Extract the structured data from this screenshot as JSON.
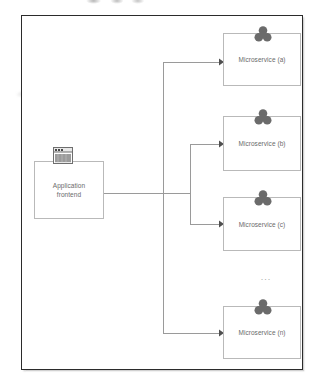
{
  "diagram": {
    "nodes": {
      "frontend": {
        "label": "Application\nfrontend",
        "icon": "browser-window-icon"
      },
      "services": [
        {
          "id": "a",
          "label": "Microservice (a)",
          "icon": "service-cluster-icon"
        },
        {
          "id": "b",
          "label": "Microservice (b)",
          "icon": "service-cluster-icon"
        },
        {
          "id": "c",
          "label": "Microservice (c)",
          "icon": "service-cluster-icon"
        },
        {
          "id": "n",
          "label": "Microservice (n)",
          "icon": "service-cluster-icon"
        }
      ],
      "continuation": "..."
    },
    "colors": {
      "frame_border": "#2b2b2b",
      "node_border": "#b9b9b9",
      "node_fill": "#ffffff",
      "label_text": "#6a6a6a",
      "connector": "#9a9a9a",
      "icon_gray": "#6e6e6e",
      "page_background": "#ffffff"
    }
  }
}
